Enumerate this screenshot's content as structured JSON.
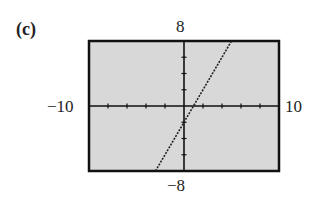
{
  "figure": {
    "part_label": "(c)"
  },
  "chart_data": {
    "type": "line",
    "title": "",
    "xlabel": "",
    "ylabel": "",
    "xlim": [
      -10,
      10
    ],
    "ylim": [
      -8,
      8
    ],
    "x_tick_labels": {
      "min": "−10",
      "max": "10"
    },
    "y_tick_labels": {
      "min": "−8",
      "max": "8"
    },
    "xscale": 2,
    "yscale": 2,
    "grid": false,
    "background": "#d8d8d8",
    "line_style": "dotted",
    "series": [
      {
        "name": "y = 2x - 2",
        "x": [
          -3,
          5
        ],
        "y": [
          -8,
          8
        ]
      }
    ]
  }
}
